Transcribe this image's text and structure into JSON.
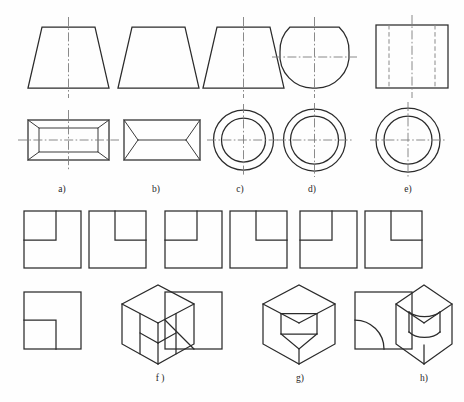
{
  "page": {
    "background_color": "#fefefe",
    "line_color": "#2b2b2b",
    "center_line_color": "#7d7d7d",
    "hidden_line_color": "#8a8a8a",
    "width": 464,
    "height": 402,
    "top_partial_text": ""
  },
  "captions": {
    "a": "a)",
    "b": "b)",
    "c": "c)",
    "d": "d)",
    "e": "e)",
    "f": "f )",
    "g": "g)",
    "h": "h)"
  },
  "figures": [
    {
      "id": "a",
      "label": "a)",
      "row": "top",
      "front_view": "isosceles-trapezoid-with-vertical-centerline",
      "top_view": "rectangle-with-inset-rectangle-and-corner-diagonals",
      "has_center_lines": true
    },
    {
      "id": "b",
      "label": "b)",
      "row": "top",
      "front_view": "isosceles-trapezoid",
      "top_view": "rectangle-with-horizontal-median-and-end-vees",
      "has_center_lines": false
    },
    {
      "id": "c",
      "label": "c)",
      "row": "top",
      "front_view": "isosceles-trapezoid-with-vertical-centerline",
      "top_view": "two-concentric-circles",
      "has_center_lines": true
    },
    {
      "id": "d",
      "label": "d)",
      "row": "top",
      "front_view": "circle-with-flat-top-and-cross-centerlines",
      "top_view": "two-concentric-circles",
      "has_center_lines": true
    },
    {
      "id": "e",
      "label": "e)",
      "row": "top",
      "front_view": "rectangle-with-two-hidden-vertical-lines",
      "top_view": "two-concentric-circles",
      "has_center_lines": true
    },
    {
      "id": "f",
      "label": "f )",
      "row": "bottom",
      "views": [
        "square-with-small-square-notch-top-left",
        "square-with-small-square-notch-top-right-offset",
        "square-with-small-square-notch-bottom-left"
      ],
      "pictorial": "isometric-cube-with-cubic-corner-notch"
    },
    {
      "id": "g",
      "label": "g)",
      "row": "bottom",
      "views": [
        "square-with-small-square-notch-top-left",
        "square-with-small-square-notch-top-right-offset",
        "square-with-diagonal-chamfer-bottom-left"
      ],
      "pictorial": "isometric-cube-with-wedge-notch"
    },
    {
      "id": "h",
      "label": "h)",
      "row": "bottom",
      "views": [
        "square-with-small-square-notch-top-left",
        "square-with-small-square-notch-top-right-offset",
        "square-with-quarter-circle-fillet-bottom-left"
      ],
      "pictorial": "isometric-cube-with-cylindrical-notch"
    }
  ]
}
